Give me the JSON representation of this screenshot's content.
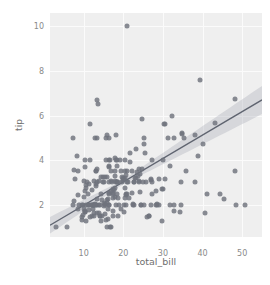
{
  "chart_data": {
    "type": "scatter",
    "title": "",
    "xlabel": "total_bill",
    "ylabel": "tip",
    "xlim": [
      1.5,
      55.0
    ],
    "ylim": [
      0.55,
      10.6
    ],
    "xticks": [
      10,
      20,
      30,
      40,
      50
    ],
    "yticks": [
      2,
      4,
      6,
      8,
      10
    ],
    "xticklabels": [
      "10",
      "20",
      "30",
      "40",
      "50"
    ],
    "yticklabels": [
      "2",
      "4",
      "6",
      "8",
      "10"
    ],
    "grid": true,
    "legend": null,
    "marker_color": "#6f737c",
    "marker_size_px": 5,
    "marker_opacity": 0.82,
    "panel_background": "#efefef",
    "grid_color": "#fbfbfb",
    "tick_label_color": "#8a8a8a",
    "axis_title_color": "#6f6f6f",
    "regression": {
      "show": true,
      "line_color": "#5f6470",
      "band_color": "#9aa0ac",
      "band_opacity": 0.3,
      "slope": 0.105,
      "intercept": 0.92,
      "x_start": 1.5,
      "x_end": 55.0,
      "y_start": 1.08,
      "y_end": 6.7,
      "band_half_width_start": 0.42,
      "band_half_width_end": 0.62,
      "band_half_width_min": 0.1
    },
    "x": [
      16.99,
      10.34,
      21.01,
      23.68,
      24.59,
      25.29,
      8.77,
      26.88,
      15.04,
      14.78,
      10.27,
      35.26,
      15.42,
      18.43,
      14.83,
      21.58,
      10.33,
      16.29,
      16.97,
      20.65,
      17.92,
      20.29,
      15.77,
      39.42,
      19.82,
      17.81,
      13.37,
      12.69,
      21.7,
      19.65,
      9.55,
      18.35,
      15.06,
      20.69,
      17.78,
      24.06,
      16.31,
      16.93,
      18.69,
      31.27,
      16.04,
      17.46,
      13.94,
      9.68,
      30.4,
      18.29,
      22.23,
      32.4,
      28.55,
      18.04,
      12.54,
      10.29,
      34.81,
      9.94,
      25.56,
      19.49,
      38.01,
      26.41,
      11.24,
      48.27,
      20.29,
      13.81,
      11.02,
      18.29,
      17.59,
      20.08,
      16.45,
      3.07,
      20.23,
      15.01,
      12.02,
      17.07,
      26.86,
      25.28,
      14.73,
      10.51,
      17.92,
      27.2,
      22.76,
      17.29,
      19.44,
      16.66,
      10.07,
      32.68,
      15.98,
      34.83,
      13.03,
      18.28,
      24.71,
      21.16,
      28.97,
      22.49,
      5.75,
      16.32,
      22.75,
      40.17,
      27.28,
      12.03,
      21.01,
      12.46,
      11.35,
      15.38,
      44.3,
      22.42,
      20.92,
      15.36,
      20.49,
      25.21,
      18.24,
      14.31,
      14,
      7.25,
      38.07,
      23.95,
      25.71,
      17.31,
      29.93,
      10.65,
      12.43,
      24.08,
      11.69,
      13.42,
      14.26,
      15.95,
      12.48,
      29.8,
      8.52,
      14.52,
      11.38,
      22.82,
      19.08,
      20.27,
      11.17,
      12.26,
      18.26,
      8.51,
      10.33,
      14.15,
      16,
      13.16,
      17.47,
      34.3,
      41.19,
      27.05,
      16.43,
      8.35,
      18.64,
      11.87,
      9.78,
      7.51,
      14.07,
      13.13,
      17.26,
      24.55,
      19.77,
      29.85,
      48.17,
      25,
      13.39,
      16.49,
      21.5,
      12.66,
      16.21,
      13.81,
      17.51,
      24.52,
      20.76,
      31.71,
      10.59,
      10.63,
      50.81,
      15.81,
      7.25,
      31.85,
      16.82,
      32.9,
      17.89,
      14.48,
      9.6,
      34.63,
      34.65,
      23.33,
      45.35,
      23.17,
      40.55,
      20.69,
      20.9,
      30.46,
      18.15,
      23.1,
      15.69,
      19.81,
      28.44,
      15.48,
      16.58,
      7.56,
      10.34,
      43.11,
      13,
      13.51,
      18.71,
      12.74,
      13,
      16.4,
      20.53,
      16.47,
      26.59,
      38.73,
      24.27,
      12.76,
      30.06,
      25.89,
      48.33,
      13.27,
      28.17,
      12.9,
      28.15,
      11.59,
      7.74,
      30.14,
      12.16,
      13.42,
      8.58,
      15.98,
      13.42,
      16.27,
      10.09,
      20.45,
      13.28,
      22.12,
      24.01,
      15.69,
      11.61,
      10.77,
      15.53,
      10.07,
      12.6,
      32.83,
      35.83,
      29.03,
      27.18,
      22.67,
      17.82,
      18.78
    ],
    "y": [
      1.01,
      1.66,
      3.5,
      3.31,
      3.61,
      4.71,
      2,
      3.12,
      1.96,
      3.23,
      1.71,
      5,
      1.57,
      3,
      3.02,
      3.92,
      1.67,
      3.71,
      3.5,
      3.35,
      4.08,
      2.75,
      2.23,
      7.58,
      3.18,
      2.34,
      2,
      2,
      4.3,
      3,
      1.45,
      2.5,
      3,
      2.45,
      3.27,
      3.6,
      2,
      3.07,
      2.31,
      5,
      2.24,
      2.54,
      3.06,
      1.32,
      5.6,
      3,
      3.5,
      6,
      2.05,
      3,
      2,
      2.6,
      5.2,
      1.56,
      4.34,
      3.51,
      3,
      1.5,
      1.76,
      6.73,
      3.21,
      2,
      1.98,
      3.76,
      2.64,
      3.15,
      2.47,
      1,
      2.01,
      2.09,
      1.97,
      3,
      3.14,
      5,
      2.2,
      1.25,
      3.08,
      4,
      3,
      2.71,
      1.83,
      4,
      1.83,
      5,
      3.25,
      5.17,
      2,
      4,
      5.85,
      3,
      3.14,
      2.02,
      1,
      3.76,
      3,
      4.73,
      3,
      1.5,
      3,
      1.8,
      2.92,
      3.23,
      2.5,
      2,
      2.5,
      2.02,
      4,
      2,
      2,
      3.25,
      2,
      2,
      5.15,
      3,
      3,
      2.5,
      2.72,
      2.88,
      2,
      3.39,
      1.47,
      3,
      1.25,
      1,
      3.08,
      2.71,
      1.83,
      1.5,
      2,
      3.18,
      4,
      1.68,
      2.5,
      2,
      4,
      3.5,
      4,
      1.5,
      1.8,
      2.92,
      2.31,
      1.68,
      2.5,
      2,
      2.52,
      4.2,
      1.48,
      2,
      2,
      2.18,
      1.5,
      2.83,
      1.5,
      2,
      3.25,
      1.25,
      3.5,
      3,
      6.7,
      5,
      2.3,
      1.5,
      1.36,
      1.63,
      1.73,
      2,
      2.5,
      2,
      2.74,
      2,
      2,
      5.14,
      5,
      3.75,
      2.61,
      2,
      3.5,
      2.5,
      2,
      2,
      3,
      3.48,
      2.24,
      4.5,
      1.61,
      2,
      10,
      3.16,
      5.15,
      3.18,
      4,
      3.11,
      2,
      2,
      1,
      3.55,
      3.68,
      5.65,
      3.5,
      6.5,
      3,
      5,
      3.5,
      2,
      3.5,
      4,
      1.5,
      4.19,
      2.56,
      2.02,
      4,
      1.44,
      2,
      5,
      2,
      2,
      2.61,
      4,
      3.16,
      5.61,
      2.64,
      1.61,
      2.45,
      2.06,
      3.6,
      3,
      3.07,
      2.31,
      2.24,
      2.54,
      3.06,
      1.32,
      5.6,
      3,
      5,
      2.36,
      1.63,
      1.73,
      3.5,
      2,
      2.5,
      2,
      2.74,
      2,
      2,
      5.14,
      5,
      3.75,
      2.61,
      2,
      3.5,
      2.5,
      2,
      2,
      3,
      3.48,
      2.24,
      4.5,
      1.61,
      2,
      10,
      3.16,
      5.15,
      3.18,
      4,
      3.11,
      2,
      2,
      1,
      3.55,
      3.68
    ]
  }
}
